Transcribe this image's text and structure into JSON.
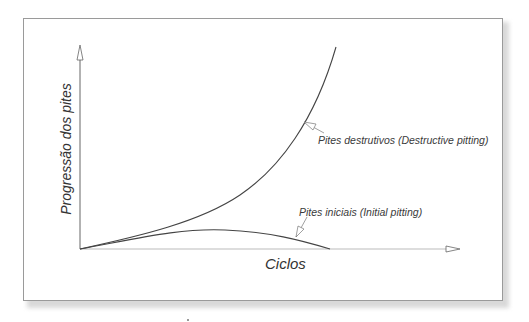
{
  "diagram": {
    "y_axis_label": "Progressão dos pites",
    "x_axis_label": "Ciclos",
    "curves": [
      {
        "id": "destructive",
        "label": "Pites destrutivos (Destructive pitting)",
        "shape": "exponential-increase"
      },
      {
        "id": "initial",
        "label": "Pites iniciais (Initial pitting)",
        "shape": "rise-then-fall"
      }
    ],
    "colors": {
      "axis": "#666666",
      "curve": "#444444",
      "frame": "#9a9a9a",
      "text": "#333333"
    }
  }
}
